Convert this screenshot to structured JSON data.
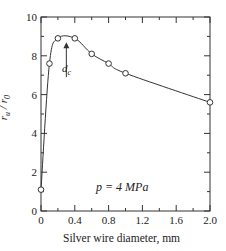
{
  "chart_data": {
    "type": "line",
    "title": "",
    "xlabel": "Silver wire diameter, mm",
    "ylabel": "r_u / r_0",
    "xlim": [
      0,
      2.0
    ],
    "ylim": [
      0,
      10
    ],
    "x_ticks": [
      "0",
      "0.4",
      "0.8",
      "1.2",
      "1.6",
      "2.0"
    ],
    "y_ticks": [
      "0",
      "2",
      "4",
      "6",
      "8",
      "10"
    ],
    "grid": false,
    "series": [
      {
        "name": "p = 4 MPa",
        "x": [
          0,
          0.1,
          0.2,
          0.4,
          0.6,
          0.8,
          1.0,
          2.0
        ],
        "y": [
          1.1,
          7.6,
          8.9,
          8.9,
          8.1,
          7.6,
          7.1,
          5.6
        ],
        "marker": "open-circle"
      }
    ],
    "annotations": [
      {
        "text": "d_c",
        "x": 0.3,
        "y": 9.0,
        "type": "arrow"
      },
      {
        "text": "p = 4 MPa",
        "x": 0.8,
        "y": 1.4
      }
    ]
  },
  "labels": {
    "xlabel": "Silver wire diameter, mm",
    "ylabel_main": "r",
    "ylabel_sub1": "u",
    "ylabel_sep": " / ",
    "ylabel_main2": "r",
    "ylabel_sub2": "0",
    "pressure": "p = 4 MPa",
    "dc_main": "d",
    "dc_sub": "c"
  }
}
